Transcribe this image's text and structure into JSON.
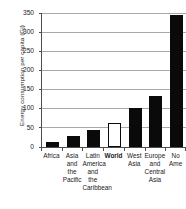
{
  "chart_data": {
    "type": "bar",
    "title": "",
    "xlabel": "",
    "ylabel": "Energy consumption per capita (Gj)",
    "ylim": [
      0,
      350
    ],
    "yticks": [
      0,
      50,
      100,
      150,
      200,
      250,
      300,
      350
    ],
    "grid": true,
    "legend": "none",
    "categories": [
      "Africa",
      "Asia and the Pacific",
      "Latin America and the Caribbean",
      "World",
      "West Asia",
      "Europe and Central Asia",
      "North America"
    ],
    "category_lines": [
      [
        "Africa"
      ],
      [
        "Asia",
        "and",
        "the",
        "Pacific"
      ],
      [
        "Latin",
        "America",
        "and",
        "the",
        "Caribbean"
      ],
      [
        "World"
      ],
      [
        "West",
        "Asia"
      ],
      [
        "Europe",
        "and",
        "Central",
        "Asia"
      ],
      [
        "No",
        "Ame"
      ]
    ],
    "values": [
      14,
      29,
      44,
      64,
      101,
      132,
      345
    ],
    "bar_styles": [
      "filled",
      "filled",
      "filled",
      "hollow",
      "filled",
      "filled",
      "filled"
    ],
    "emphasis": [
      false,
      false,
      false,
      true,
      false,
      false,
      false
    ],
    "colors": {
      "bar_fill": "#0a0a0a",
      "bar_hollow_fill": "#ffffff",
      "bar_outline": "#0a0a0a",
      "gridline": "#a8a8a8",
      "axis": "#4d4d4d",
      "text": "#1a1a1a",
      "background": "#ffffff"
    }
  }
}
